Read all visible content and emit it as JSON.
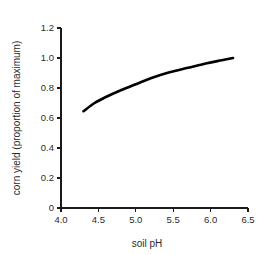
{
  "chart_data": {
    "type": "line",
    "title": "",
    "xlabel": "soil pH",
    "ylabel": "corn yield (proportion of maximum)",
    "xlim": [
      4.0,
      6.5
    ],
    "ylim": [
      0,
      1.2
    ],
    "xticks": [
      "4.0",
      "4.5",
      "5.0",
      "5.5",
      "6.0",
      "6.5"
    ],
    "xtick_values": [
      4.0,
      4.5,
      5.0,
      5.5,
      6.0,
      6.5
    ],
    "yticks": [
      "0",
      "0.2",
      "0.4",
      "0.6",
      "0.8",
      "1.0",
      "1.2"
    ],
    "ytick_values": [
      0,
      0.2,
      0.4,
      0.6,
      0.8,
      1.0,
      1.2
    ],
    "grid": false,
    "legend": false,
    "legend_position": "none",
    "series": [
      {
        "name": "corn yield",
        "color": "#000000",
        "x": [
          4.3,
          4.45,
          4.6,
          4.8,
          5.0,
          5.2,
          5.45,
          5.7,
          5.95,
          6.15,
          6.3
        ],
        "y": [
          0.645,
          0.7,
          0.74,
          0.785,
          0.825,
          0.865,
          0.905,
          0.935,
          0.965,
          0.985,
          1.0
        ]
      }
    ],
    "annotations": []
  },
  "axis_labels": {
    "x_title": "soil pH",
    "y_title": "corn yield (proportion of maximum)"
  }
}
